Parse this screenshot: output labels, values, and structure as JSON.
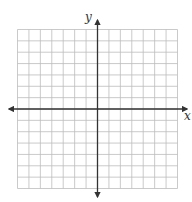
{
  "diagram": {
    "type": "coordinate-plane",
    "x_axis_label": "x",
    "y_axis_label": "y",
    "grid": {
      "columns": 14,
      "rows": 14,
      "cells_left_of_y_axis": 7,
      "cells_right_of_y_axis": 7,
      "cells_above_x_axis": 7,
      "cells_below_x_axis": 7
    },
    "colors": {
      "grid_line": "#bdbdbd",
      "axis_line": "#333333",
      "background": "#ffffff"
    }
  }
}
